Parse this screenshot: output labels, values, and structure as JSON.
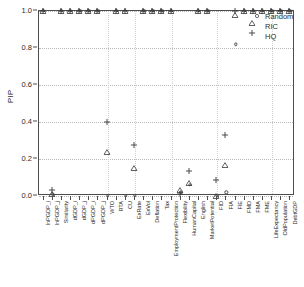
{
  "chart_data": {
    "type": "scatter",
    "title": "",
    "xlabel": "",
    "ylabel": "PIP",
    "ylim": [
      0.0,
      1.0
    ],
    "yticks": [
      0.0,
      0.2,
      0.4,
      0.6,
      0.8,
      1.0
    ],
    "ytick_labels": [
      "0.0",
      "0.2",
      "0.4",
      "0.6",
      "0.8",
      "1.0"
    ],
    "grid": true,
    "legend_position": "top-right",
    "categories": [
      "lnPGDP_i",
      "lnPGDP_j",
      "Similarity",
      "dGDP_i",
      "dGDP_j",
      "dPGDP_i",
      "dPGDP_j",
      "WTO",
      "RTA",
      "CU",
      "ExRate",
      "ExVol",
      "Deflation",
      "Tax",
      "EmploymentProtection",
      "Flexibility",
      "HumanCapital",
      "English",
      "MarketPotential",
      "FID",
      "FIA",
      "FIE",
      "FMD",
      "FMA",
      "FME",
      "LifeExpectancy",
      "OldPopulation",
      "DebtGDP"
    ],
    "series": [
      {
        "name": "Random",
        "marker": "circle",
        "values": [
          1.0,
          0.01,
          1.0,
          1.0,
          1.0,
          1.0,
          1.0,
          0.0,
          1.0,
          0.0,
          0.0,
          1.0,
          1.0,
          1.0,
          1.0,
          0.02,
          0.06,
          1.0,
          1.0,
          0.0,
          0.02,
          0.82,
          1.0,
          1.0,
          1.0,
          1.0,
          1.0,
          1.0
        ]
      },
      {
        "name": "RIC",
        "marker": "triangle",
        "values": [
          1.0,
          0.01,
          1.0,
          1.0,
          1.0,
          1.0,
          1.0,
          0.24,
          1.0,
          1.0,
          0.15,
          1.0,
          1.0,
          1.0,
          1.0,
          0.03,
          0.07,
          1.0,
          1.0,
          0.0,
          0.17,
          0.98,
          1.0,
          1.0,
          1.0,
          1.0,
          1.0,
          1.0
        ]
      },
      {
        "name": "HQ",
        "marker": "plus",
        "values": [
          1.0,
          0.03,
          1.0,
          1.0,
          1.0,
          1.0,
          1.0,
          0.4,
          1.0,
          1.0,
          0.275,
          1.0,
          1.0,
          1.0,
          1.0,
          0.01,
          0.135,
          1.0,
          1.0,
          0.085,
          0.33,
          1.0,
          1.0,
          1.0,
          1.0,
          1.0,
          1.0,
          1.0
        ]
      }
    ],
    "colors": {
      "marker": "#3a3a3a",
      "axis": "#4d4d4d",
      "grid": "#b9b9b9",
      "background": "#ffffff"
    }
  },
  "legend": {
    "items": [
      {
        "label": "Random",
        "marker": "circle"
      },
      {
        "label": "RIC",
        "marker": "triangle"
      },
      {
        "label": "HQ",
        "marker": "plus"
      }
    ]
  }
}
